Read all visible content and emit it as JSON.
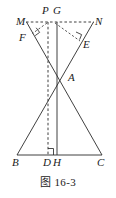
{
  "figure": {
    "caption": "图 16-3",
    "stroke_color": "#2b2b2b",
    "label_color": "#1b1b1b",
    "background_color": "#ffffff",
    "labels": {
      "M": "M",
      "N": "N",
      "P": "P",
      "G": "G",
      "F": "F",
      "E": "E",
      "A": "A",
      "B": "B",
      "D": "D",
      "H": "H",
      "C": "C"
    },
    "points": {
      "M": [
        27,
        22
      ],
      "N": [
        93,
        22
      ],
      "P": [
        48,
        22
      ],
      "G": [
        57,
        22
      ],
      "F": [
        33,
        33
      ],
      "E": [
        79,
        41
      ],
      "A": [
        62,
        74
      ],
      "B": [
        17,
        155
      ],
      "D": [
        48,
        155
      ],
      "H": [
        57,
        155
      ],
      "C": [
        102,
        155
      ]
    },
    "segments": [
      {
        "name": "segment-MN",
        "from": "M",
        "to": "N",
        "style": "dashed"
      },
      {
        "name": "segment-M-to-C",
        "from": "M",
        "to": "C",
        "style": "solid"
      },
      {
        "name": "segment-N-to-B",
        "from": "N",
        "to": "B",
        "style": "solid"
      },
      {
        "name": "segment-BC",
        "from": "B",
        "to": "C",
        "style": "solid"
      },
      {
        "name": "segment-PD-altitude",
        "from": "P",
        "to": "D",
        "style": "dashed"
      },
      {
        "name": "segment-GH-median",
        "from": "G",
        "to": "H",
        "style": "solid"
      },
      {
        "name": "segment-P-to-E",
        "from": "P",
        "to": "E",
        "style": "dashed"
      },
      {
        "name": "segment-P-to-F",
        "from": "P",
        "to": "F",
        "style": "dashed"
      }
    ],
    "right_angle_marks": [
      {
        "name": "right-angle-at-F",
        "vertex": "F"
      },
      {
        "name": "right-angle-at-E",
        "vertex": "E"
      },
      {
        "name": "right-angle-at-D",
        "vertex": "D"
      }
    ]
  }
}
